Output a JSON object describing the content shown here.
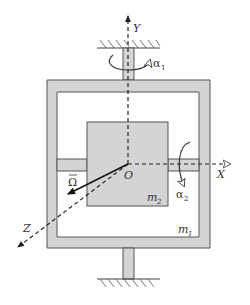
{
  "diagram": {
    "labels": {
      "y_axis": "Y",
      "x_axis": "X",
      "z_axis": "Z",
      "origin": "O",
      "alpha1": "α",
      "alpha1_sub": "1",
      "alpha2": "α",
      "alpha2_sub": "2",
      "omega": "Ω",
      "omega_bar": "¯",
      "m1": "m",
      "m1_sub": "1",
      "m2": "m",
      "m2_sub": "2"
    },
    "colors": {
      "fill_gray": "#d4d4d4",
      "stroke": "#555555",
      "dash": "#333333",
      "background": "#ffffff"
    },
    "components": [
      {
        "name": "outer-frame",
        "mass": "m1"
      },
      {
        "name": "inner-block",
        "mass": "m2"
      },
      {
        "name": "top-shaft"
      },
      {
        "name": "bottom-shaft"
      },
      {
        "name": "left-shaft"
      },
      {
        "name": "right-shaft"
      },
      {
        "name": "top-ground"
      },
      {
        "name": "bottom-ground"
      }
    ]
  }
}
